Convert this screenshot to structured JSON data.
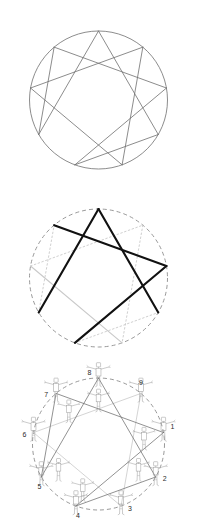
{
  "figure": {
    "panel_count": 3,
    "background_color": "#ffffff"
  },
  "colors": {
    "thin_line": "#6e6e6e",
    "bold_line": "#111111",
    "faint_line": "#c9c9c9",
    "dashed_circle": "#8d8d8d",
    "figure_line": "#9a9a9a",
    "label_text": "#2b2b2b"
  },
  "geometry": {
    "center_x": 98.5,
    "radius": 69,
    "point_count": 9,
    "start_angle_deg": -90,
    "hexad_sequence": [
      1,
      4,
      2,
      8,
      5,
      7
    ],
    "triad_sequence": [
      9,
      3,
      6
    ]
  },
  "panels": [
    {
      "id": "panel-1",
      "name": "plain-enneagram",
      "caption": "",
      "circle_style": "solid",
      "center_y": 100,
      "line_emphasis": "uniform"
    },
    {
      "id": "panel-2",
      "name": "highlighted-enneagram",
      "caption": "",
      "circle_style": "dashed",
      "center_y": 100,
      "line_emphasis": "partial-bold"
    },
    {
      "id": "panel-3",
      "name": "numbered-enneagram-with-figures",
      "caption": "",
      "circle_style": "dashed",
      "center_y": 88,
      "line_emphasis": "uniform-thin",
      "shows_figures": true,
      "shows_numbers": true
    }
  ],
  "enneagram_points": [
    {
      "number": "1",
      "angle_deg": -10,
      "label_dx": 9,
      "label_dy": -5
    },
    {
      "number": "2",
      "angle_deg": 30,
      "label_dx": 9,
      "label_dy": 2
    },
    {
      "number": "3",
      "angle_deg": 70,
      "label_dx": 9,
      "label_dy": 3
    },
    {
      "number": "4",
      "angle_deg": 110,
      "label_dx": 2,
      "label_dy": 10
    },
    {
      "number": "5",
      "angle_deg": 150,
      "label_dx": -2,
      "label_dy": 10
    },
    {
      "number": "6",
      "angle_deg": 190,
      "label_dx": -9,
      "label_dy": 3
    },
    {
      "number": "7",
      "angle_deg": 230,
      "label_dx": -10,
      "label_dy": 2
    },
    {
      "number": "8",
      "angle_deg": 270,
      "label_dx": -9,
      "label_dy": -5
    },
    {
      "number": "9",
      "angle_deg": 310,
      "label_dx": 0,
      "label_dy": -10
    }
  ],
  "number_labels": [
    "1",
    "2",
    "3",
    "4",
    "5",
    "6",
    "7",
    "8",
    "9"
  ],
  "figure_positions": [
    {
      "point": "9",
      "row": "outer"
    },
    {
      "point": "1",
      "row": "outer"
    },
    {
      "point": "2",
      "row": "outer"
    },
    {
      "point": "3",
      "row": "outer"
    },
    {
      "point": "4",
      "row": "outer"
    },
    {
      "point": "5",
      "row": "outer"
    },
    {
      "point": "6",
      "row": "outer"
    },
    {
      "point": "7",
      "row": "outer"
    },
    {
      "point": "8",
      "row": "outer"
    },
    {
      "point": "1i",
      "row": "inner"
    },
    {
      "point": "2i",
      "row": "inner"
    },
    {
      "point": "4i",
      "row": "inner"
    },
    {
      "point": "5i",
      "row": "inner"
    },
    {
      "point": "7i",
      "row": "inner"
    },
    {
      "point": "8i",
      "row": "inner"
    }
  ]
}
